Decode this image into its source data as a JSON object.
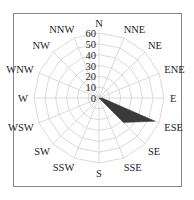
{
  "chart_data": {
    "type": "radar",
    "title": "",
    "directions": [
      "N",
      "NNE",
      "NE",
      "ENE",
      "E",
      "ESE",
      "SE",
      "SSE",
      "S",
      "SSW",
      "SW",
      "WSW",
      "W",
      "WNW",
      "NW",
      "NNW"
    ],
    "values": [
      0,
      0,
      0,
      0,
      3,
      56,
      32,
      0,
      0,
      0,
      0,
      0,
      0,
      0,
      0,
      0
    ],
    "radial_ticks": [
      0,
      10,
      20,
      30,
      40,
      50,
      60
    ],
    "rlim": [
      0,
      60
    ],
    "grid": true,
    "fill_color": "#3a3a3a",
    "grid_color": "#d0d0d0",
    "frame": true
  }
}
